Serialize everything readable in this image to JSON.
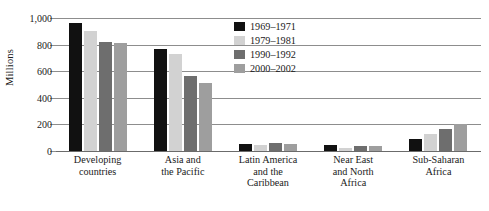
{
  "chart_data": {
    "type": "bar",
    "title": "",
    "xlabel": "",
    "ylabel": "Millions",
    "ylim": [
      0,
      1000
    ],
    "yticks": [
      0,
      200,
      400,
      600,
      800,
      1000
    ],
    "ytick_labels": [
      "0",
      "200",
      "400",
      "600",
      "800",
      "1,000"
    ],
    "grid": true,
    "legend_position": "top-center-right",
    "categories": [
      "Developing\ncountries",
      "Asia and\nthe Pacific",
      "Latin America\nand the\nCaribbean",
      "Near East\nand North\nAfrica",
      "Sub-Saharan\nAfrica"
    ],
    "category_lines": [
      [
        "Developing",
        "countries"
      ],
      [
        "Asia and",
        "the Pacific"
      ],
      [
        "Latin America",
        "and the",
        "Caribbean"
      ],
      [
        "Near East",
        "and North",
        "Africa"
      ],
      [
        "Sub-Saharan",
        "Africa"
      ]
    ],
    "series": [
      {
        "name": "1969–1971",
        "color": "#111111",
        "values": [
          960,
          765,
          55,
          45,
          90
        ]
      },
      {
        "name": "1979–1981",
        "color": "#d2d2d2",
        "values": [
          900,
          730,
          45,
          25,
          125
        ]
      },
      {
        "name": "1990–1992",
        "color": "#6e6e6e",
        "values": [
          820,
          565,
          60,
          35,
          165
        ]
      },
      {
        "name": "2000–2002",
        "color": "#9e9e9e",
        "values": [
          815,
          515,
          50,
          40,
          200
        ]
      }
    ]
  },
  "axis": {
    "y_title": "Millions"
  },
  "caption": {
    "text": ""
  }
}
